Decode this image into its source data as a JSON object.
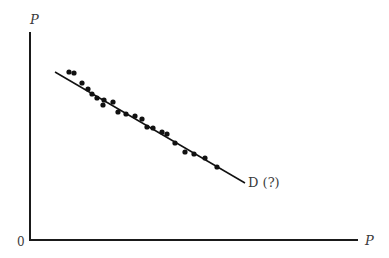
{
  "chart_data": {
    "type": "scatter",
    "title": "",
    "xlabel": "P",
    "ylabel": "P",
    "origin_label": "0",
    "grid": false,
    "legend": "none",
    "axis_ticks": false,
    "series": [
      {
        "name": "observations",
        "kind": "points",
        "points_px": [
          [
            69,
            72
          ],
          [
            74,
            73
          ],
          [
            82,
            83
          ],
          [
            88,
            89
          ],
          [
            92,
            94
          ],
          [
            97,
            98
          ],
          [
            103,
            105
          ],
          [
            104,
            100
          ],
          [
            113,
            102
          ],
          [
            118,
            112
          ],
          [
            126,
            114
          ],
          [
            135,
            116
          ],
          [
            142,
            119
          ],
          [
            147,
            127
          ],
          [
            153,
            128
          ],
          [
            162,
            132
          ],
          [
            167,
            134
          ],
          [
            175,
            143
          ],
          [
            185,
            152
          ],
          [
            194,
            154
          ],
          [
            205,
            158
          ],
          [
            217,
            167
          ]
        ]
      },
      {
        "name": "D (?)",
        "kind": "fitted-line",
        "start_px": [
          55,
          72
        ],
        "end_px": [
          245,
          183
        ]
      }
    ],
    "annotations": [
      {
        "text": "D (?)",
        "x_px": 248,
        "y_px": 187
      }
    ]
  },
  "labels": {
    "y_axis": "P",
    "x_axis": "P",
    "origin": "0",
    "curve": "D (?)"
  },
  "colors": {
    "axis": "#1a1a1a",
    "points": "#111111",
    "line": "#111111",
    "text": "#3a3a3a"
  }
}
